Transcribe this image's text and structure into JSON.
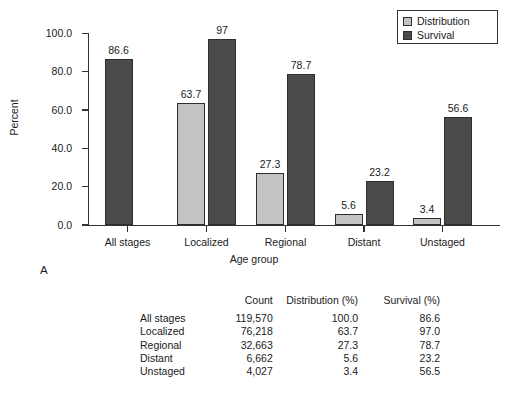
{
  "chart_data": {
    "type": "bar",
    "title": "",
    "xlabel": "Age group",
    "ylabel": "Percent",
    "ylim": [
      0,
      100
    ],
    "yticks": [
      "0.0",
      "20.0",
      "40.0",
      "60.0",
      "80.0",
      "100.0"
    ],
    "ytick_values": [
      0,
      20,
      40,
      60,
      80,
      100
    ],
    "categories": [
      "All stages",
      "Localized",
      "Regional",
      "Distant",
      "Unstaged"
    ],
    "legend_position": "top-right",
    "grid": false,
    "series": [
      {
        "name": "Distribution",
        "color": "#c3c3c3",
        "values": [
          null,
          63.7,
          27.3,
          5.6,
          3.4
        ],
        "labels": [
          "",
          "63.7",
          "27.3",
          "5.6",
          "3.4"
        ]
      },
      {
        "name": "Survival",
        "color": "#4b4b4b",
        "values": [
          86.6,
          97.0,
          78.7,
          23.2,
          56.6
        ],
        "labels": [
          "86.6",
          "97",
          "78.7",
          "23.2",
          "56.6"
        ]
      }
    ]
  },
  "panel": {
    "label": "A"
  },
  "legend": {
    "items": [
      {
        "label": "Distribution",
        "color": "#c3c3c3"
      },
      {
        "label": "Survival",
        "color": "#4b4b4b"
      }
    ]
  },
  "table": {
    "headers": [
      "",
      "Count",
      "Distribution (%)",
      "Survival (%)"
    ],
    "rows": [
      {
        "stage": "All stages",
        "count": "119,570",
        "distribution": "100.0",
        "survival": "86.6"
      },
      {
        "stage": "Localized",
        "count": "76,218",
        "distribution": "63.7",
        "survival": "97.0"
      },
      {
        "stage": "Regional",
        "count": "32,663",
        "distribution": "27.3",
        "survival": "78.7"
      },
      {
        "stage": "Distant",
        "count": "6,662",
        "distribution": "5.6",
        "survival": "23.2"
      },
      {
        "stage": "Unstaged",
        "count": "4,027",
        "distribution": "3.4",
        "survival": "56.5"
      }
    ]
  }
}
